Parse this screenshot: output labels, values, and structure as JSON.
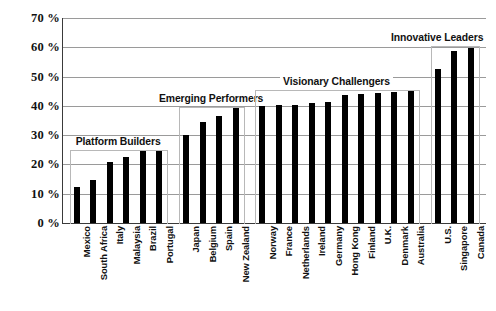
{
  "chart_data": {
    "type": "bar",
    "title": "",
    "subtitle": "",
    "xlabel": "",
    "ylabel": "",
    "ylim": [
      0,
      70
    ],
    "ytick_step": 10,
    "ytick_labels": [
      "0 %",
      "10 %",
      "20 %",
      "30 %",
      "40 %",
      "50 %",
      "60 %",
      "70 %"
    ],
    "ytick_values": [
      0,
      10,
      20,
      30,
      40,
      50,
      60,
      70
    ],
    "grid": true,
    "legend": "none",
    "bar_color": "#000000",
    "gridline_color": "#9a9a9a",
    "axis_color": "#3a3a3a",
    "bracket_color": "#b8b8b8",
    "categories": [
      "Mexico",
      "South Africa",
      "Italy",
      "Malaysia",
      "Brazil",
      "Portugal",
      "Japan",
      "Belgium",
      "Spain",
      "New Zealand",
      "Norway",
      "France",
      "Netherlands",
      "Ireland",
      "Germany",
      "Hong Kong",
      "Finland",
      "U.K.",
      "Denmark",
      "Australia",
      "U.S.",
      "Singapore",
      "Canada"
    ],
    "values": [
      12.3,
      14.7,
      21.0,
      22.4,
      24.7,
      24.9,
      30.0,
      34.5,
      36.5,
      39.2,
      39.9,
      40.2,
      40.4,
      41.0,
      41.4,
      43.7,
      44.2,
      44.4,
      44.9,
      45.2,
      52.6,
      58.7,
      59.9
    ],
    "groups": [
      {
        "label": "Platform Builders",
        "start_index": 0,
        "end_index": 5,
        "bracket_top_value": 25.0
      },
      {
        "label": "Emerging Performers",
        "start_index": 6,
        "end_index": 9,
        "bracket_top_value": 39.5
      },
      {
        "label": "Visionary Challengers",
        "start_index": 10,
        "end_index": 19,
        "bracket_top_value": 45.5
      },
      {
        "label": "Innovative Leaders",
        "start_index": 20,
        "end_index": 22,
        "bracket_top_value": 60.3
      }
    ]
  }
}
